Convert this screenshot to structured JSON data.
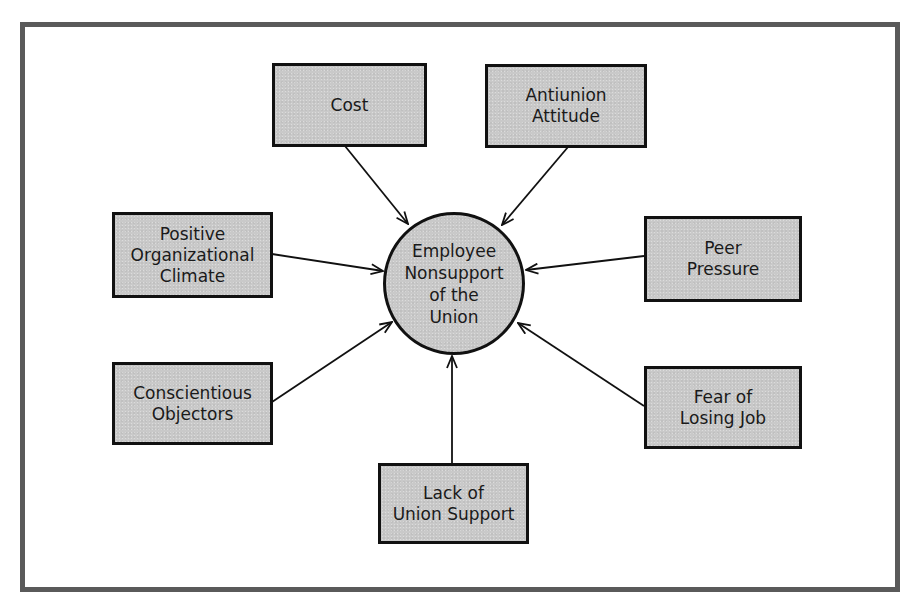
{
  "figure": {
    "caption_partial": "Figure ... Why Employees Do Not Support Unions"
  },
  "diagram": {
    "center": {
      "id": "employee-nonsupport",
      "label": "Employee\nNonsupport\nof the\nUnion"
    },
    "factors": [
      {
        "id": "cost",
        "label": "Cost"
      },
      {
        "id": "antiunion-attitude",
        "label": "Antiunion\nAttitude"
      },
      {
        "id": "positive-organizational-climate",
        "label": "Positive\nOrganizational\nClimate"
      },
      {
        "id": "peer-pressure",
        "label": "Peer\nPressure"
      },
      {
        "id": "conscientious-objectors",
        "label": "Conscientious\nObjectors"
      },
      {
        "id": "fear-of-losing-job",
        "label": "Fear of\nLosing Job"
      },
      {
        "id": "lack-of-union-support",
        "label": "Lack of\nUnion Support"
      }
    ],
    "edges": [
      {
        "from": "cost",
        "to": "employee-nonsupport"
      },
      {
        "from": "antiunion-attitude",
        "to": "employee-nonsupport"
      },
      {
        "from": "positive-organizational-climate",
        "to": "employee-nonsupport"
      },
      {
        "from": "peer-pressure",
        "to": "employee-nonsupport"
      },
      {
        "from": "conscientious-objectors",
        "to": "employee-nonsupport"
      },
      {
        "from": "fear-of-losing-job",
        "to": "employee-nonsupport"
      },
      {
        "from": "lack-of-union-support",
        "to": "employee-nonsupport"
      }
    ],
    "colors": {
      "node_fill": "#c9c9c9",
      "node_border": "#111111",
      "frame_border": "#5a5a5a",
      "arrow": "#111111"
    }
  }
}
